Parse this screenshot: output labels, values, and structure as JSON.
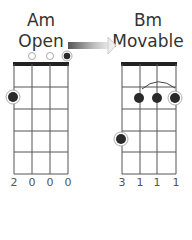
{
  "chords": [
    {
      "name": "Am",
      "type": "Open",
      "fingering": [
        "2",
        "0",
        "0",
        "0"
      ],
      "open_strings": [
        2,
        3
      ],
      "root_string": 4,
      "dots": [
        {
          "string": 1,
          "fret": 2,
          "root": true
        },
        {
          "string": 4,
          "fret": 0,
          "root": true
        }
      ]
    },
    {
      "name": "Bm",
      "type": "Movable",
      "fingering": [
        "3",
        "1",
        "1",
        "1"
      ],
      "barre": {
        "fret": 1,
        "from_string": 2,
        "to_string": 4
      },
      "dots": [
        {
          "string": 1,
          "fret": 3,
          "root": true
        },
        {
          "string": 2,
          "fret": 1,
          "root": false
        },
        {
          "string": 3,
          "fret": 1,
          "root": false
        },
        {
          "string": 4,
          "fret": 1,
          "root": true
        }
      ]
    }
  ],
  "transition_arrow": {
    "from": "Am",
    "to": "Bm",
    "icon": "gradient-arrow-right-icon"
  },
  "colors": {
    "line": "#555555",
    "nut": "#222222",
    "dot": "#2a2a2a",
    "open": "#aaaaaa"
  }
}
